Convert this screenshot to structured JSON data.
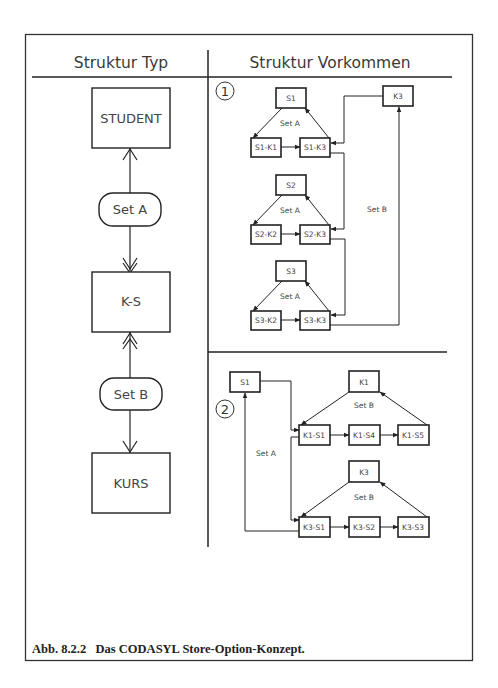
{
  "headers": {
    "left": "Struktur Typ",
    "right": "Struktur Vorkommen"
  },
  "structure_type": {
    "nodes": [
      {
        "id": "student",
        "label": "STUDENT",
        "shape": "rect"
      },
      {
        "id": "set_a",
        "label": "Set A",
        "shape": "rounded"
      },
      {
        "id": "ks",
        "label": "K-S",
        "shape": "rect"
      },
      {
        "id": "set_b",
        "label": "Set B",
        "shape": "rounded"
      },
      {
        "id": "kurs",
        "label": "KURS",
        "shape": "rect"
      }
    ]
  },
  "occurrence_1": {
    "marker": "1",
    "groups": [
      {
        "owner": "S1",
        "members": [
          "S1-K1",
          "S1-K3"
        ],
        "set_label": "Set A"
      },
      {
        "owner": "S2",
        "members": [
          "S2-K2",
          "S2-K3"
        ],
        "set_label": "Set A"
      },
      {
        "owner": "S3",
        "members": [
          "S3-K2",
          "S3-K3"
        ],
        "set_label": "Set A"
      }
    ],
    "k_owner": "K3",
    "k_set_label": "Set B"
  },
  "occurrence_2": {
    "marker": "2",
    "s_owner": "S1",
    "s_set_label": "Set A",
    "groups": [
      {
        "owner": "K1",
        "members": [
          "K1-S1",
          "K1-S4",
          "K1-S5"
        ],
        "set_label": "Set B"
      },
      {
        "owner": "K3",
        "members": [
          "K3-S1",
          "K3-S2",
          "K3-S3"
        ],
        "set_label": "Set B"
      }
    ]
  },
  "caption": "Abb. 8.2.2   Das CODASYL Store-Option-Konzept."
}
